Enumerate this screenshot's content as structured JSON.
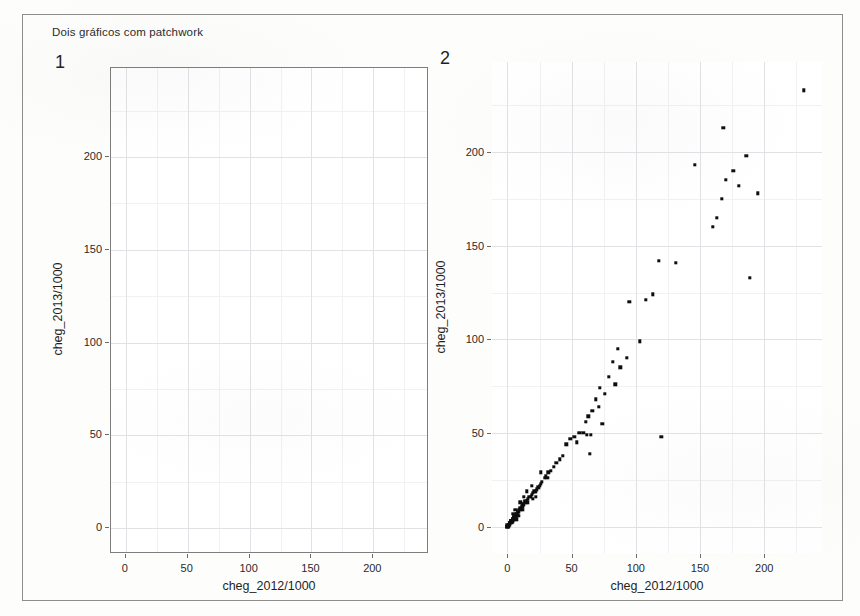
{
  "figure": {
    "title": "Dois gráficos com patchwork",
    "background": "#fdfdfc",
    "border_color": "#8d8d8d",
    "point_color": "#0d0d0d",
    "grid_color": "#e9e9ec"
  },
  "panels": [
    {
      "tag": "1",
      "boxed": true,
      "has_points": false
    },
    {
      "tag": "2",
      "boxed": false,
      "has_points": true
    }
  ],
  "chart_data": [
    {
      "type": "scatter",
      "panel_tag": "1",
      "title": "",
      "xlabel": "cheg_2012/1000",
      "ylabel": "cheg_2013/1000",
      "xticks": [
        0,
        50,
        100,
        150,
        200
      ],
      "yticks": [
        0,
        50,
        100,
        150,
        200
      ],
      "xlim": [
        -12,
        245
      ],
      "ylim": [
        -14,
        248
      ],
      "grid": true,
      "legend": "none",
      "points": []
    },
    {
      "type": "scatter",
      "panel_tag": "2",
      "title": "",
      "xlabel": "cheg_2012/1000",
      "ylabel": "cheg_2013/1000",
      "xticks": [
        0,
        50,
        100,
        150,
        200
      ],
      "yticks": [
        0,
        50,
        100,
        150,
        200
      ],
      "xlim": [
        -12,
        245
      ],
      "ylim": [
        -14,
        248
      ],
      "grid": true,
      "legend": "none",
      "points": [
        [
          231,
          233
        ],
        [
          168,
          213
        ],
        [
          146,
          193
        ],
        [
          186,
          198
        ],
        [
          176,
          190
        ],
        [
          170,
          185
        ],
        [
          180,
          182
        ],
        [
          195,
          178
        ],
        [
          167,
          175
        ],
        [
          163,
          165
        ],
        [
          160,
          160
        ],
        [
          189,
          133
        ],
        [
          118,
          142
        ],
        [
          131,
          141
        ],
        [
          113,
          124
        ],
        [
          108,
          121
        ],
        [
          95,
          120
        ],
        [
          103,
          99
        ],
        [
          86,
          95
        ],
        [
          93,
          90
        ],
        [
          82,
          88
        ],
        [
          88,
          85
        ],
        [
          79,
          80
        ],
        [
          84,
          76
        ],
        [
          72,
          74
        ],
        [
          76,
          71
        ],
        [
          69,
          68
        ],
        [
          71,
          64
        ],
        [
          66,
          62
        ],
        [
          63,
          59
        ],
        [
          61,
          56
        ],
        [
          74,
          55
        ],
        [
          120,
          48
        ],
        [
          56,
          50
        ],
        [
          59,
          50
        ],
        [
          62,
          49
        ],
        [
          65,
          49
        ],
        [
          52,
          48
        ],
        [
          49,
          47
        ],
        [
          54,
          45
        ],
        [
          46,
          44
        ],
        [
          64,
          39
        ],
        [
          43,
          38
        ],
        [
          41,
          36
        ],
        [
          38,
          34
        ],
        [
          36,
          32
        ],
        [
          34,
          30
        ],
        [
          32,
          29
        ],
        [
          30,
          27
        ],
        [
          29,
          26
        ],
        [
          27,
          24
        ],
        [
          26,
          23
        ],
        [
          25,
          22
        ],
        [
          24,
          21
        ],
        [
          23,
          20
        ],
        [
          22,
          19
        ],
        [
          21,
          19
        ],
        [
          20,
          18
        ],
        [
          19,
          17
        ],
        [
          18,
          16
        ],
        [
          17,
          16
        ],
        [
          16,
          15
        ],
        [
          15,
          14
        ],
        [
          14,
          14
        ],
        [
          14,
          13
        ],
        [
          13,
          12
        ],
        [
          12,
          12
        ],
        [
          12,
          11
        ],
        [
          11,
          11
        ],
        [
          11,
          10
        ],
        [
          10,
          10
        ],
        [
          10,
          9
        ],
        [
          9,
          9
        ],
        [
          9,
          8
        ],
        [
          8,
          8
        ],
        [
          8,
          8
        ],
        [
          8,
          7
        ],
        [
          7,
          7
        ],
        [
          7,
          7
        ],
        [
          7,
          6
        ],
        [
          6,
          6
        ],
        [
          6,
          6
        ],
        [
          6,
          5
        ],
        [
          5,
          5
        ],
        [
          5,
          5
        ],
        [
          5,
          5
        ],
        [
          5,
          4
        ],
        [
          4,
          4
        ],
        [
          4,
          4
        ],
        [
          4,
          4
        ],
        [
          4,
          3
        ],
        [
          3,
          3
        ],
        [
          3,
          3
        ],
        [
          3,
          3
        ],
        [
          3,
          3
        ],
        [
          3,
          2
        ],
        [
          2,
          2
        ],
        [
          2,
          2
        ],
        [
          2,
          2
        ],
        [
          2,
          2
        ],
        [
          2,
          2
        ],
        [
          2,
          1
        ],
        [
          1,
          1
        ],
        [
          1,
          1
        ],
        [
          1,
          1
        ],
        [
          1,
          1
        ],
        [
          1,
          1
        ],
        [
          1,
          1
        ],
        [
          1,
          0
        ],
        [
          0,
          1
        ],
        [
          0,
          0
        ],
        [
          0,
          0
        ],
        [
          0,
          0
        ],
        [
          0,
          0
        ],
        [
          10,
          13
        ],
        [
          13,
          16
        ],
        [
          16,
          13
        ],
        [
          19,
          22
        ],
        [
          22,
          16
        ],
        [
          6,
          9
        ],
        [
          9,
          6
        ],
        [
          4,
          7
        ],
        [
          7,
          4
        ],
        [
          12,
          9
        ],
        [
          15,
          19
        ],
        [
          20,
          15
        ],
        [
          26,
          29
        ],
        [
          31,
          26
        ]
      ]
    }
  ]
}
